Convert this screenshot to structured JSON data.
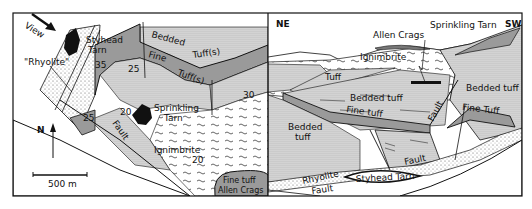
{
  "figure": {
    "map_panel": {
      "view_label": "View",
      "north_label": "N",
      "scale_label": "500 m",
      "labels": {
        "styhead_tarn_1": "Styhead",
        "styhead_tarn_2": "Tarn",
        "rhyolite": "\"Rhyolite\"",
        "bedded": "Bedded",
        "tuffs_upper": "Tuff(s)",
        "fine": "Fine",
        "tuffs_lower": "Tuff(s)",
        "sprinkling_1": "Sprinkling",
        "sprinkling_2": "Tarn",
        "fault": "Fault",
        "ignimbrite": "Ignimbrite",
        "fine_tuff": "Fine tuff",
        "allen_crags": "Allen Crags"
      },
      "dips": [
        "35",
        "25",
        "25",
        "20",
        "30",
        "20"
      ]
    },
    "section_panel": {
      "ne_label": "NE",
      "sw_label": "SW",
      "labels": {
        "allen_crags": "Allen Crags",
        "sprinkling_tarn": "Sprinkling Tarn",
        "ignimbrite": "Ignimbrite",
        "tuff": "Tuff",
        "bedded_tuff_center": "Bedded tuff",
        "bedded_tuff_right": "Bedded tuff",
        "fine_tuff_center": "Fine tuff",
        "fine_tuff_right": "Fine Tuff",
        "bedded_tuff_left_1": "Bedded",
        "bedded_tuff_left_2": "tuff",
        "fault_upper": "Fault",
        "fault_lower": "Fault",
        "fault_bottom": "Fault",
        "rhyolite": "Rhyolite",
        "styhead_tarn": "Styhead Tarn"
      }
    },
    "colors": {
      "ink": "#111111",
      "grey_band": "#9a9a9a",
      "stipple": "#d0d0d0",
      "paper": "#ffffff"
    }
  }
}
